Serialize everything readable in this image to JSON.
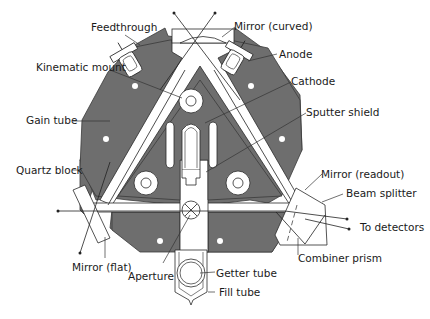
{
  "diagram": {
    "colors": {
      "block": "#6e6e6e",
      "outline": "#2a2a2a",
      "background": "#ffffff",
      "text": "#1a1a1a"
    },
    "labels": {
      "feedthrough": "Feedthrough",
      "mirror_curved": "Mirror (curved)",
      "anode": "Anode",
      "kinematic_mount": "Kinematic mount",
      "cathode": "Cathode",
      "gain_tube": "Gain tube",
      "sputter_shield": "Sputter shield",
      "quartz_block": "Quartz block",
      "mirror_readout": "Mirror (readout)",
      "beam_splitter": "Beam splitter",
      "to_detectors": "To detectors",
      "mirror_flat": "Mirror (flat)",
      "combiner_prism": "Combiner prism",
      "aperture": "Aperture",
      "getter_tube": "Getter tube",
      "fill_tube": "Fill tube"
    }
  }
}
